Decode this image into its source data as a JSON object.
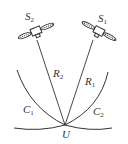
{
  "diagram": {
    "satellites": [
      {
        "id": "S2",
        "label": "S",
        "sub": "2"
      },
      {
        "id": "S1",
        "label": "S",
        "sub": "1"
      }
    ],
    "ranges": [
      {
        "id": "R2",
        "label": "R",
        "sub": "2"
      },
      {
        "id": "R1",
        "label": "R",
        "sub": "1"
      }
    ],
    "curves": [
      {
        "id": "C1",
        "label": "C",
        "sub": "1"
      },
      {
        "id": "C2",
        "label": "C",
        "sub": "2"
      }
    ],
    "user": {
      "label": "U"
    },
    "colors": {
      "line": "#333333",
      "background": "#ffffff"
    }
  }
}
